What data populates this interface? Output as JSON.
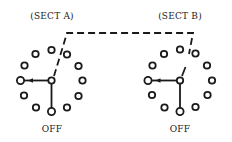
{
  "diagram": {
    "type": "two-section rotary switch, ganged",
    "sections": [
      {
        "label": "(SECT A)",
        "position_label": "OFF",
        "hub": {
          "x": 51.5,
          "y": 80.5
        },
        "radius": 31,
        "contacts": 12,
        "selected_contact": "left",
        "off_contact": "bottom"
      },
      {
        "label": "(SECT B)",
        "position_label": "OFF",
        "hub": {
          "x": 180,
          "y": 80.5
        },
        "radius": 32,
        "contacts": 12,
        "selected_contact": "left",
        "off_contact": "bottom"
      }
    ],
    "linkage": {
      "style": "dashed",
      "description": "mechanical gang linkage between section rotors"
    },
    "colors": {
      "ink": "#1a1a1a",
      "background": "#ffffff"
    }
  }
}
